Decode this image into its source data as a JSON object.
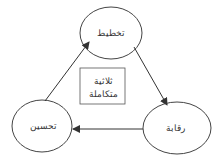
{
  "diagram": {
    "nodes": {
      "planning": {
        "label": "تخطيط"
      },
      "control": {
        "label": "رقابة"
      },
      "improvement": {
        "label": "تحسين"
      }
    },
    "center": {
      "line1": "ثلاثية",
      "line2": "متكاملة"
    },
    "edges": [
      {
        "from": "planning",
        "to": "control"
      },
      {
        "from": "control",
        "to": "improvement"
      },
      {
        "from": "improvement",
        "to": "planning"
      }
    ],
    "colors": {
      "stroke": "#333333",
      "background": "#ffffff"
    }
  }
}
